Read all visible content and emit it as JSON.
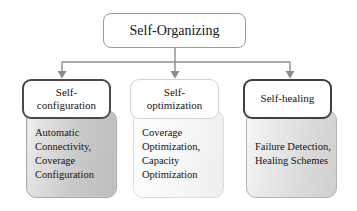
{
  "diagram": {
    "type": "hierarchy-tree",
    "title_node": {
      "label": "Self-Organizing"
    },
    "branches": [
      {
        "id": "self-configuration",
        "header": "Self-\nconfiguration",
        "header_line1": "Self-",
        "header_line2": "configuration",
        "body": "Automatic Connectivity, Coverage Configuration",
        "body_lines": [
          "Automatic",
          "Connectivity,",
          "Coverage",
          "Configuration"
        ],
        "border_color": "#4a4a4a",
        "body_fill": "#c9c9c9"
      },
      {
        "id": "self-optimization",
        "header": "Self-\noptimization",
        "header_line1": "Self-",
        "header_line2": "optimization",
        "body": "Coverage Optimization, Capacity Optimization",
        "body_lines": [
          "Coverage",
          "Optimization,",
          "Capacity",
          "Optimization"
        ],
        "border_color": "#d2d2d2",
        "body_fill": "#f6f6f6"
      },
      {
        "id": "self-healing",
        "header": "Self-healing",
        "header_line1": "Self-healing",
        "header_line2": "",
        "body": "Failure Detection, Healing Schemes",
        "body_lines": [
          "Failure",
          "Detection,",
          "Healing",
          "Schemes"
        ],
        "border_color": "#3f3f3f",
        "body_fill": "#dadada"
      }
    ],
    "connector_color": "#8c8c8c",
    "background": "#ffffff"
  }
}
